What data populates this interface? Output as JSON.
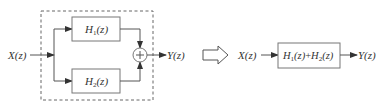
{
  "left_diagram": {
    "input_label": "X(z)",
    "output_label": "Y(z)",
    "block_top": {
      "base": "H",
      "sub": "1",
      "arg": "(z)"
    },
    "block_bottom": {
      "base": "H",
      "sub": "2",
      "arg": "(z)"
    },
    "summing_junction": "+",
    "grouping": "dashed-boundary"
  },
  "equivalence_arrow": "hollow-right-arrow",
  "right_diagram": {
    "input_label": "X(z)",
    "output_label": "Y(z)",
    "block": {
      "t1_base": "H",
      "t1_sub": "1",
      "t1_arg": "(z)",
      "plus": "+",
      "t2_base": "H",
      "t2_sub": "2",
      "t2_arg": "(z)"
    }
  },
  "colors": {
    "line": "#555555",
    "text": "#333333",
    "box_border": "#777777",
    "background": "#ffffff"
  }
}
